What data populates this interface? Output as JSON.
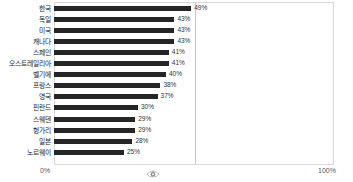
{
  "chart_data": {
    "type": "bar",
    "orientation": "horizontal",
    "title": "",
    "subtitle": "",
    "xlabel": "",
    "ylabel": "",
    "xlim": [
      0,
      100
    ],
    "grid": true,
    "gridlines_at": [
      50
    ],
    "legend": null,
    "categories": [
      "한국",
      "독일",
      "미국",
      "캐나다",
      "스페인",
      "오스트레일리아",
      "벨기에",
      "프랑스",
      "영국",
      "핀란드",
      "스웨덴",
      "헝가리",
      "일본",
      "노르웨이"
    ],
    "values": [
      49,
      43,
      43,
      43,
      41,
      41,
      40,
      38,
      37,
      30,
      29,
      29,
      28,
      25
    ],
    "value_labels": [
      "49%",
      "43%",
      "43%",
      "43%",
      "41%",
      "41%",
      "40%",
      "38%",
      "37%",
      "30%",
      "29%",
      "29%",
      "28%",
      "25%"
    ],
    "axis_ticks": [
      "0%",
      "100%"
    ],
    "bar_color": "#262626",
    "gridline_color": "#c9c9c9",
    "frame_color": "#d8d8d8",
    "background_color": "#ffffff"
  },
  "axis": {
    "left_tick": "0%",
    "right_tick": "100%"
  },
  "marker": {
    "name": "eye-marker",
    "position_percent": 50
  }
}
